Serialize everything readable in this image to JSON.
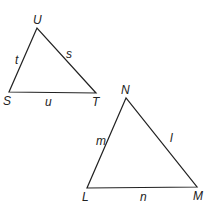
{
  "diagram": {
    "stroke_color": "#222222",
    "background": "#ffffff",
    "triangles": [
      {
        "name": "STU",
        "vertices": {
          "U": {
            "label": "U",
            "x": 37,
            "y": 28
          },
          "S": {
            "label": "S",
            "x": 9,
            "y": 92
          },
          "T": {
            "label": "T",
            "x": 96,
            "y": 93
          }
        },
        "sides": {
          "SU": {
            "label": "t"
          },
          "UT": {
            "label": "s"
          },
          "ST": {
            "label": "u"
          }
        }
      },
      {
        "name": "LMN",
        "vertices": {
          "N": {
            "label": "N",
            "x": 126,
            "y": 98
          },
          "L": {
            "label": "L",
            "x": 87,
            "y": 188
          },
          "M": {
            "label": "M",
            "x": 197,
            "y": 187
          }
        },
        "sides": {
          "LN": {
            "label": "m"
          },
          "NM": {
            "label": "l"
          },
          "LM": {
            "label": "n"
          }
        }
      }
    ]
  }
}
